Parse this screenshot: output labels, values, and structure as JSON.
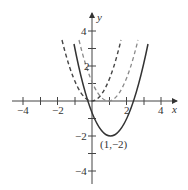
{
  "figure": {
    "x_axis_label": "x",
    "y_axis_label": "y",
    "x_ticks": [
      {
        "value": -4,
        "label": "−4"
      },
      {
        "value": -2,
        "label": "−2"
      },
      {
        "value": 2,
        "label": "2"
      },
      {
        "value": 4,
        "label": "4"
      }
    ],
    "y_ticks": [
      {
        "value": 4,
        "label": "4"
      },
      {
        "value": 2,
        "label": "2"
      },
      {
        "value": -2,
        "label": "−2"
      },
      {
        "value": -4,
        "label": "−4"
      }
    ],
    "vertex_label": "(1,−2)",
    "curves": [
      {
        "name": "parabola-dashed-origin",
        "style": "dashed",
        "vertex": [
          0,
          0
        ],
        "color": "#444444"
      },
      {
        "name": "parabola-dashed-shifted",
        "style": "dashed",
        "vertex": [
          1,
          0
        ],
        "color": "#8a8a8a"
      },
      {
        "name": "parabola-solid",
        "style": "solid",
        "vertex": [
          1,
          -2
        ],
        "color": "#333333"
      }
    ],
    "axis_range": {
      "x": [
        -4.5,
        4.8
      ],
      "y": [
        -4.8,
        5
      ]
    }
  }
}
